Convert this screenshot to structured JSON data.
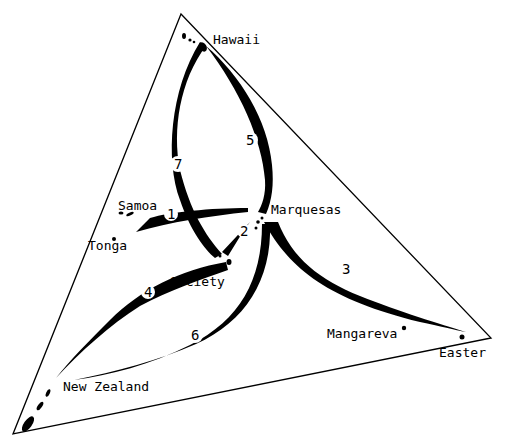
{
  "diagram": {
    "type": "map-diagram",
    "colors": {
      "ink": "#000000",
      "background": "#ffffff"
    },
    "triangle": {
      "vertices": [
        [
          181,
          14
        ],
        [
          491,
          338
        ],
        [
          13,
          434
        ]
      ]
    },
    "islands": [
      {
        "name": "Hawaii",
        "label": "Hawaii",
        "label_x": 213,
        "label_y": 44
      },
      {
        "name": "Samoa",
        "label": "Samoa",
        "label_x": 118,
        "label_y": 210
      },
      {
        "name": "Tonga",
        "label": "Tonga",
        "label_x": 88,
        "label_y": 250
      },
      {
        "name": "Marquesas",
        "label": "Marquesas",
        "label_x": 271,
        "label_y": 214
      },
      {
        "name": "Society",
        "label": "Society",
        "label_x": 170,
        "label_y": 286
      },
      {
        "name": "Mangareva",
        "label": "Mangareva",
        "label_x": 327,
        "label_y": 338
      },
      {
        "name": "Easter",
        "label": "Easter",
        "label_x": 439,
        "label_y": 357
      },
      {
        "name": "New Zealand",
        "label": "New Zealand",
        "label_x": 63,
        "label_y": 391
      }
    ],
    "routes": [
      {
        "number": "1",
        "from": "Samoa",
        "to": "Marquesas",
        "label_x": 167,
        "label_y": 219
      },
      {
        "number": "2",
        "from": "Marquesas",
        "to": "Society",
        "label_x": 240,
        "label_y": 236
      },
      {
        "number": "3",
        "from": "Marquesas",
        "to": "Easter",
        "label_x": 342,
        "label_y": 274
      },
      {
        "number": "4",
        "from": "Society",
        "to": "New Zealand",
        "label_x": 144,
        "label_y": 297
      },
      {
        "number": "5",
        "from": "Marquesas",
        "to": "Hawaii",
        "label_x": 246,
        "label_y": 145
      },
      {
        "number": "6",
        "from": "Marquesas",
        "to": "New Zealand",
        "label_x": 191,
        "label_y": 340
      },
      {
        "number": "7",
        "from": "Society",
        "to": "Hawaii",
        "label_x": 174,
        "label_y": 169
      }
    ]
  }
}
